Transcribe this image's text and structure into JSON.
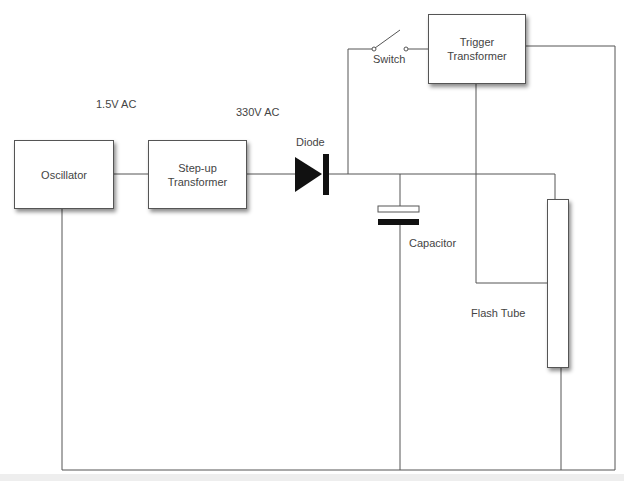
{
  "diagram": {
    "blocks": {
      "oscillator": "Oscillator",
      "stepup_line1": "Step-up",
      "stepup_line2": "Transformer",
      "trigger_line1": "Trigger",
      "trigger_line2": "Transformer"
    },
    "labels": {
      "input_voltage": "1.5V AC",
      "output_voltage": "330V AC",
      "diode": "Diode",
      "switch": "Switch",
      "capacitor": "Capacitor",
      "flash_tube": "Flash Tube"
    },
    "colors": {
      "wire": "#555555",
      "component_fill": "#111111",
      "background": "#ffffff"
    }
  }
}
